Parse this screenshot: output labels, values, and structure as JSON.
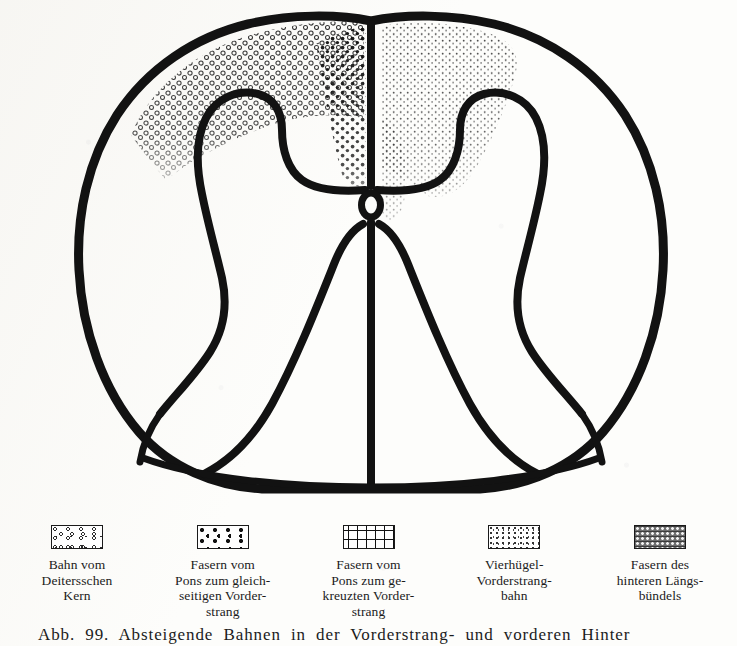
{
  "figure": {
    "kind": "spinal-cord-cross-section",
    "regions": [
      {
        "name": "left-dorsal-open-circle-tract",
        "pattern": "open-circles",
        "side": "left",
        "location": "dorsal-posterior-funiculus"
      },
      {
        "name": "left-paramedian-solid-dot-tract",
        "pattern": "solid-dots",
        "side": "left",
        "location": "paramedian-dorsal"
      },
      {
        "name": "right-dorsal-fine-stipple-tract",
        "pattern": "fine-stipple",
        "side": "right",
        "location": "dorsal-posterior-funiculus"
      },
      {
        "name": "central-canal",
        "pattern": "outline-oval",
        "side": "midline",
        "location": "center"
      }
    ],
    "structures": [
      "outer-cord-outline",
      "left-gray-matter-horn",
      "right-gray-matter-horn",
      "anterior-median-fissure",
      "central-canal",
      "left-ventral-funiculus-border",
      "right-ventral-funiculus-border"
    ]
  },
  "legend": {
    "items": [
      {
        "swatch": "open-circles",
        "label": "Bahn vom\nDeitersschen\nKern"
      },
      {
        "swatch": "solid-dots",
        "label": "Fasern vom\nPons zum gleich-\nseitigen Vorder-\nstrang"
      },
      {
        "swatch": "crosses",
        "label": "Fasern vom\nPons zum ge-\nkreuzten Vorder-\nstrang"
      },
      {
        "swatch": "fine-stipple",
        "label": "Vierhügel-\nVorderstrang-\nbahn"
      },
      {
        "swatch": "mesh",
        "label": "Fasern des\nhinteren Längs-\nbündels"
      }
    ]
  },
  "caption": {
    "text": "Abb. 99.  Absteigende  Bahnen  in  der  Vorderstrang-  und  vorderen  Hinter"
  },
  "colors": {
    "ink": "#141414",
    "paper": "#fdfdfb",
    "mesh_fill": "#6e6e6e"
  }
}
